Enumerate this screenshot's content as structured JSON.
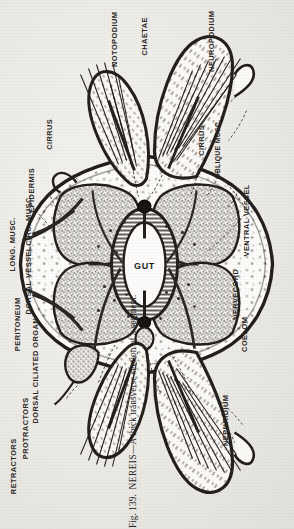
{
  "figure": {
    "organism": "NEREIS",
    "number": "Fig. 139.",
    "caption_tail": "—A thick transverse section of a segment.",
    "caption_full": "Fig. 139.  NEREIS.—A thick transverse section of a segment."
  },
  "ink_color": "#211e1b",
  "paper_color": "#eceae6",
  "labels": {
    "notopodium": "NOTOPODIUM",
    "chaetae": "CHAETAE",
    "neuropodium": "NEUROPODIUM",
    "cirrus_upper": "CIRRUS",
    "cirrus_lower": "CIRRUS",
    "oblique_musc": "OBLIQUE MUSC.",
    "epidermis": "EPIDERMIS",
    "circ_musc": "CIRC. MUSC.",
    "long_musc": "LONG. MUSC.",
    "dorsal_vessel": "DORSAL VESSEL",
    "peritoneum": "PERITONEUM",
    "dorsal_ciliated_organ": "DORSAL CILIATED ORGAN",
    "protractors": "PROTRACTORS",
    "retractors": "RETRACTORS",
    "gut": "GUT",
    "nervecord": "NERVECORD",
    "ventral_vessel": "VENTRAL VESSEL",
    "coelom": "COELOM",
    "nephridium": "NEPHRIDIUM"
  }
}
